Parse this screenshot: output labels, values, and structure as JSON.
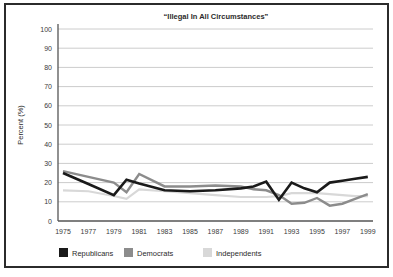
{
  "chart_data": {
    "type": "line",
    "title": "“Illegal In All Circumstances”",
    "ylabel": "Percent (%)",
    "xlabel": "",
    "ylim": [
      0,
      100
    ],
    "ytick_step": 10,
    "grid": "horizontal",
    "legend_position": "bottom-left",
    "x": [
      1975,
      1977,
      1979,
      1980,
      1981,
      1983,
      1985,
      1987,
      1989,
      1990,
      1991,
      1992,
      1993,
      1994,
      1995,
      1996,
      1997,
      1998,
      1999
    ],
    "x_tick_labels": [
      "1975",
      "1977",
      "1979",
      "1981",
      "1983",
      "1985",
      "1987",
      "1989",
      "1991",
      "1993",
      "1995",
      "1997",
      "1999"
    ],
    "x_tick_years": [
      1975,
      1977,
      1979,
      1981,
      1983,
      1985,
      1987,
      1989,
      1991,
      1993,
      1995,
      1997,
      1999
    ],
    "series": [
      {
        "name": "Republicans",
        "color": "#1a1a1a",
        "values": [
          25,
          19.25,
          13.5,
          21.5,
          19.5,
          16,
          15.5,
          16,
          17,
          18,
          20.5,
          11,
          20,
          17,
          15,
          20,
          21,
          22,
          23
        ]
      },
      {
        "name": "Democrats",
        "color": "#8c8c8c",
        "values": [
          26,
          23,
          20,
          15,
          24.5,
          18,
          18,
          18.5,
          18,
          16.5,
          16,
          13.5,
          9,
          9.5,
          12,
          8,
          9,
          11.5,
          14
        ]
      },
      {
        "name": "Independents",
        "color": "#d8d8d8",
        "values": [
          16,
          15.5,
          13,
          11.5,
          16.5,
          15.5,
          14.5,
          13.5,
          12.5,
          12.5,
          12.5,
          13,
          14.5,
          14.5,
          14.5,
          14,
          13.5,
          13,
          13
        ]
      }
    ],
    "colors": {
      "frame_border": "#2b2b2b",
      "gridline": "#cccccc",
      "axis": "#555555",
      "background": "#ffffff"
    }
  }
}
